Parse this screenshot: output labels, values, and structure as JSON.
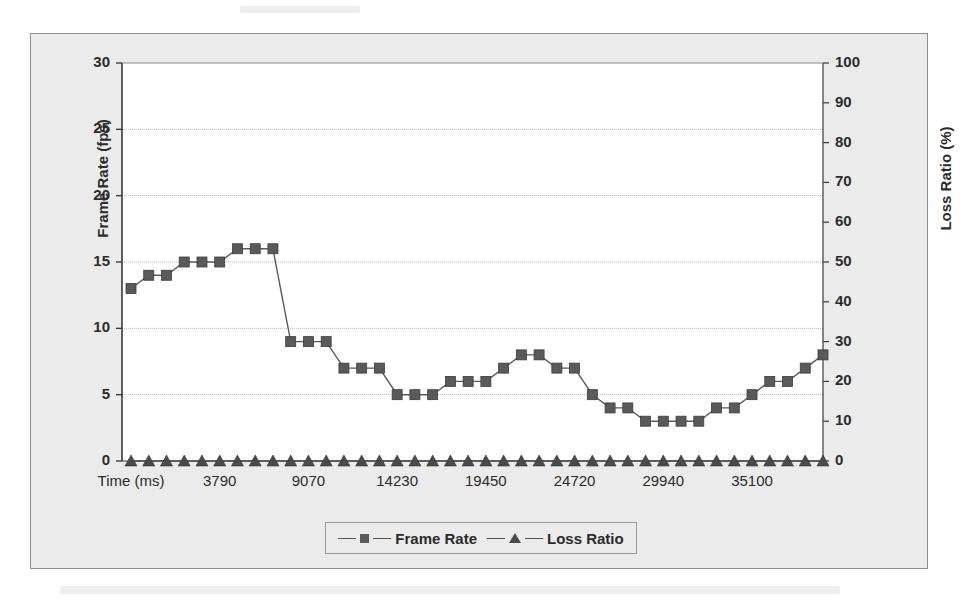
{
  "chart_data": {
    "type": "line",
    "title": "",
    "subtitle": "",
    "xlabel": "Time (ms)",
    "ylabel": "Frame Rate (fps)",
    "y2label": "Loss Ratio (%)",
    "grid": true,
    "legend_position": "bottom",
    "ylim": [
      0,
      30
    ],
    "yticks": [
      0,
      5,
      10,
      15,
      20,
      25,
      30
    ],
    "y2lim": [
      0,
      100
    ],
    "y2ticks": [
      0,
      10,
      20,
      30,
      40,
      50,
      60,
      70,
      80,
      90,
      100
    ],
    "xtick_labels": [
      "Time (ms)",
      "3790",
      "9070",
      "14230",
      "19450",
      "24720",
      "29940",
      "35100"
    ],
    "xtick_indices": [
      0,
      5,
      10,
      15,
      20,
      25,
      30,
      35
    ],
    "n_points": 40,
    "series": [
      {
        "name": "Frame Rate",
        "axis": "left",
        "marker": "square",
        "color": "#5a5a5a",
        "values": [
          13,
          14,
          14,
          15,
          15,
          15,
          16,
          16,
          16,
          9,
          9,
          9,
          7,
          7,
          7,
          5,
          5,
          5,
          6,
          6,
          6,
          7,
          8,
          8,
          7,
          7,
          5,
          4,
          4,
          3,
          3,
          3,
          3,
          4,
          4,
          5,
          6,
          6,
          7,
          8
        ]
      },
      {
        "name": "Loss Ratio",
        "axis": "right",
        "marker": "triangle",
        "color": "#4a4a4a",
        "values": [
          0,
          0,
          0,
          0,
          0,
          0,
          0,
          0,
          0,
          0,
          0,
          0,
          0,
          0,
          0,
          0,
          0,
          0,
          0,
          0,
          0,
          0,
          0,
          0,
          0,
          0,
          0,
          0,
          0,
          0,
          0,
          0,
          0,
          0,
          0,
          0,
          0,
          0,
          0,
          0
        ]
      }
    ]
  },
  "legend": {
    "entries": [
      {
        "label": "Frame Rate",
        "marker": "square-marker"
      },
      {
        "label": "Loss Ratio",
        "marker": "triangle-marker"
      }
    ]
  },
  "axes": {
    "left_label": "Frame Rate (fps)",
    "right_label": "Loss Ratio (%)",
    "left_ticks": [
      "30",
      "25",
      "20",
      "15",
      "10",
      "5",
      "0"
    ],
    "right_ticks": [
      "100",
      "90",
      "80",
      "70",
      "60",
      "50",
      "40",
      "30",
      "20",
      "10",
      "0"
    ],
    "x_ticks": [
      "Time (ms)",
      "3790",
      "9070",
      "14230",
      "19450",
      "24720",
      "29940",
      "35100"
    ]
  },
  "colors": {
    "plot_background": "#ffffff",
    "frame_background": "#ebebeb",
    "frame_border": "#8f8f8f",
    "series_frame_rate": "#5a5a5a",
    "series_loss_ratio": "#4a4a4a",
    "gridline": "#b5b5b5",
    "text": "#2b2b2b"
  }
}
